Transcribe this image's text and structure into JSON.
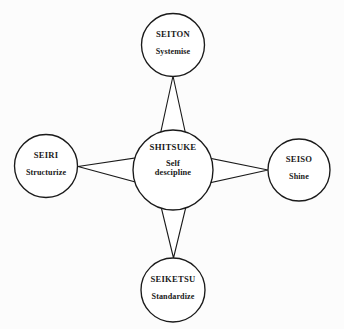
{
  "diagram": {
    "type": "5s-hub-and-spoke",
    "background_color": "#fcfcfc",
    "stroke_color": "#1a1a1a",
    "text_color": "#191919",
    "center": {
      "id": "shitsuke",
      "title": "SHITSUKE",
      "subtitle_line1": "Self",
      "subtitle_line2": "descipline",
      "cx": 173,
      "cy": 170,
      "r": 40
    },
    "nodes": [
      {
        "id": "seiton",
        "title": "SEITON",
        "subtitle": "Systemise",
        "position": "top",
        "cx": 173,
        "cy": 45,
        "r": 31.5
      },
      {
        "id": "seiri",
        "title": "SEIRI",
        "subtitle": "Structurize",
        "position": "left",
        "cx": 46,
        "cy": 166,
        "r": 31.5
      },
      {
        "id": "seiso",
        "title": "SEISO",
        "subtitle": "Shine",
        "position": "right",
        "cx": 299,
        "cy": 170,
        "r": 31
      },
      {
        "id": "seiketsu",
        "title": "SEIKETSU",
        "subtitle": "Standardize",
        "position": "bottom",
        "cx": 173,
        "cy": 290,
        "r": 32
      }
    ],
    "connectors": [
      {
        "id": "connector-center-to-seiton",
        "from": "shitsuke",
        "to": "seiton",
        "shape": "tapered-wedge",
        "wide_end": "center"
      },
      {
        "id": "connector-center-to-seiri",
        "from": "shitsuke",
        "to": "seiri",
        "shape": "tapered-wedge",
        "wide_end": "center"
      },
      {
        "id": "connector-center-to-seiso",
        "from": "shitsuke",
        "to": "seiso",
        "shape": "tapered-wedge",
        "wide_end": "center"
      },
      {
        "id": "connector-center-to-seiketsu",
        "from": "shitsuke",
        "to": "seiketsu",
        "shape": "tapered-wedge",
        "wide_end": "center"
      }
    ]
  }
}
